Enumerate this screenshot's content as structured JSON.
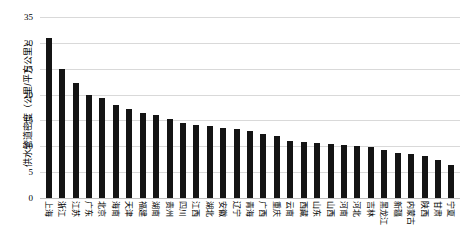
{
  "chart_data": {
    "type": "bar",
    "title": "",
    "xlabel": "",
    "ylabel": "供水管道密度（公里/平方公里）",
    "ylim": [
      0,
      35
    ],
    "yticks": [
      0,
      5,
      10,
      15,
      20,
      25,
      30,
      35
    ],
    "grid": true,
    "legend": "none",
    "bar_color": "#141414",
    "categories": [
      "上海",
      "浙江",
      "江苏",
      "广东",
      "北京",
      "海南",
      "天津",
      "福建",
      "湖南",
      "贵州",
      "四川",
      "江西",
      "湖北",
      "安徽",
      "辽宁",
      "青海",
      "广西",
      "重庆",
      "云南",
      "西藏",
      "山东",
      "山西",
      "河南",
      "河北",
      "吉林",
      "黑龙江",
      "新疆",
      "内蒙古",
      "陕西",
      "甘肃",
      "宁夏"
    ],
    "values": [
      31.0,
      24.9,
      22.3,
      20.0,
      19.3,
      18.0,
      17.2,
      16.5,
      16.0,
      15.3,
      14.6,
      14.2,
      13.9,
      13.6,
      13.3,
      13.0,
      12.3,
      11.9,
      11.0,
      10.8,
      10.6,
      10.4,
      10.2,
      10.0,
      9.8,
      9.2,
      8.8,
      8.5,
      8.2,
      7.4,
      6.4
    ]
  }
}
